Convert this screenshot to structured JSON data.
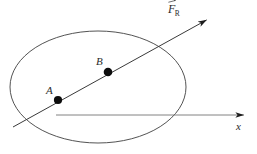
{
  "figure": {
    "type": "physics-free-body-diagram",
    "background_color": "#ffffff",
    "width": 257,
    "height": 154,
    "stroke_color": "#3a3a3a",
    "axis_color": "#6e6e6e",
    "point_color": "#111111",
    "label_color": "#2b2b2b",
    "ellipse": {
      "name": "rigid-body-outline",
      "center_x": 98,
      "center_y": 87,
      "radius_x": 88,
      "radius_y": 56,
      "stroke_width": 1,
      "fill": "none"
    },
    "force_vector": {
      "name": "resultant-force-vector",
      "label_base": "F",
      "label_subscript": "R",
      "label_full": "F⃗R",
      "has_overhead_arrow": true,
      "start_x": 13,
      "start_y": 127,
      "end_x": 212,
      "end_y": 17,
      "arrowhead": "solid-filled"
    },
    "x_axis": {
      "name": "x-axis",
      "label": "x",
      "start_x": 56,
      "start_y": 115,
      "end_x": 247,
      "end_y": 115,
      "arrowhead": "solid-filled"
    },
    "points": [
      {
        "name": "point-a",
        "label": "A",
        "x": 58,
        "y": 100,
        "radius": 4.1
      },
      {
        "name": "point-b",
        "label": "B",
        "x": 108,
        "y": 72,
        "radius": 4.3
      }
    ]
  }
}
